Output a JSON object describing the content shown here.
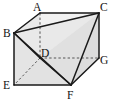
{
  "figure": {
    "kind": "cube-with-inscribed-tetrahedron",
    "projection": "oblique-parallel",
    "width": 116,
    "height": 104,
    "background_color": "#ffffff",
    "stroke_color": "#1a1a1a",
    "hidden_stroke_color": "#4d4d4d",
    "face_fill_light": "#efefef",
    "face_fill_mid": "#e3e3e3",
    "face_fill_dark": "#d6d6d6",
    "vertices": [
      {
        "id": "A",
        "label": "A",
        "x": 40.0,
        "y": 13.0,
        "label_x": 33.0,
        "label_y": 10.5,
        "hidden": false
      },
      {
        "id": "B",
        "label": "B",
        "x": 14.0,
        "y": 33.0,
        "label_x": 5.5,
        "label_y": 36.0,
        "hidden": false
      },
      {
        "id": "C",
        "label": "C",
        "x": 99.0,
        "y": 13.0,
        "label_x": 99.5,
        "label_y": 11.0,
        "hidden": false
      },
      {
        "id": "D",
        "label": "D",
        "x": 40.0,
        "y": 58.0,
        "label_x": 41.5,
        "label_y": 58.5,
        "hidden": true
      },
      {
        "id": "E",
        "label": "E",
        "x": 14.0,
        "y": 85.0,
        "label_x": 5.0,
        "label_y": 88.5,
        "hidden": false
      },
      {
        "id": "F",
        "label": "F",
        "x": 71.0,
        "y": 85.0,
        "label_x": 67.5,
        "label_y": 99.0,
        "hidden": false
      },
      {
        "id": "G",
        "label": "G",
        "x": 99.0,
        "y": 58.0,
        "label_x": 100.0,
        "label_y": 63.0,
        "hidden": false
      }
    ],
    "solid_edges": [
      {
        "from": "A",
        "to": "C",
        "role": "cube-top-back-edge"
      },
      {
        "from": "A",
        "to": "B",
        "role": "cube-top-left-edge"
      },
      {
        "from": "B",
        "to": "E",
        "role": "cube-front-left-vertical"
      },
      {
        "from": "E",
        "to": "F",
        "role": "cube-bottom-front-edge"
      },
      {
        "from": "F",
        "to": "G",
        "role": "cube-bottom-right-edge"
      },
      {
        "from": "G",
        "to": "C",
        "role": "cube-right-vertical"
      },
      {
        "from": "C",
        "to": "F",
        "role": "cube-front-right-diagonal"
      },
      {
        "from": "B",
        "to": "C",
        "role": "tetrahedron-edge"
      },
      {
        "from": "B",
        "to": "D",
        "role": "tetrahedron-edge"
      },
      {
        "from": "B",
        "to": "F",
        "role": "tetrahedron-edge"
      },
      {
        "from": "D",
        "to": "F",
        "role": "tetrahedron-edge"
      },
      {
        "from": "D",
        "to": "C",
        "role": "tetrahedron-edge"
      }
    ],
    "dashed_edges": [
      {
        "from": "A",
        "to": "D",
        "role": "hidden-vertical-edge"
      },
      {
        "from": "D",
        "to": "G",
        "role": "hidden-back-edge"
      },
      {
        "from": "D",
        "to": "E",
        "role": "hidden-bottom-diagonal"
      }
    ],
    "faces": [
      {
        "id": "left-face",
        "points": "14,33 40,13 40,58 14,85",
        "shade": "#e6e6e6"
      },
      {
        "id": "top-face",
        "points": "40,13 99,13 99,58 40,58",
        "shade": "#f2f2f2"
      },
      {
        "id": "front-face",
        "points": "14,85 40,58 99,58 71,85",
        "shade": "#e0e0e0"
      },
      {
        "id": "right-face",
        "points": "99,13 99,58 71,85 71,85",
        "shade": "#dadada"
      }
    ]
  }
}
